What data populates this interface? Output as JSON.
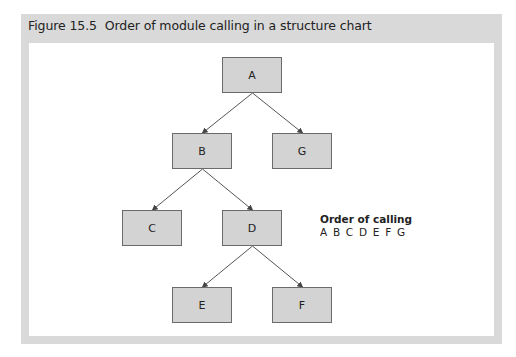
{
  "figure": {
    "number": "Figure 15.5",
    "title": "Order of module calling in a structure chart"
  },
  "diagram": {
    "type": "structure-chart",
    "nodes": [
      {
        "id": "A",
        "label": "A",
        "x": 222,
        "y": 57
      },
      {
        "id": "B",
        "label": "B",
        "x": 172,
        "y": 133
      },
      {
        "id": "G",
        "label": "G",
        "x": 272,
        "y": 133
      },
      {
        "id": "C",
        "label": "C",
        "x": 122,
        "y": 210
      },
      {
        "id": "D",
        "label": "D",
        "x": 222,
        "y": 210
      },
      {
        "id": "E",
        "label": "E",
        "x": 172,
        "y": 287
      },
      {
        "id": "F",
        "label": "F",
        "x": 272,
        "y": 287
      }
    ],
    "edges": [
      {
        "from": "A",
        "to": "B"
      },
      {
        "from": "A",
        "to": "G"
      },
      {
        "from": "B",
        "to": "C"
      },
      {
        "from": "B",
        "to": "D"
      },
      {
        "from": "D",
        "to": "E"
      },
      {
        "from": "D",
        "to": "F"
      }
    ]
  },
  "legend": {
    "title": "Order of calling",
    "sequence": "A B C D E F G"
  },
  "colors": {
    "frame": "#d9d9d9",
    "node_fill": "#d3d3d3",
    "node_border": "#6b6b6b",
    "edge": "#555555"
  }
}
